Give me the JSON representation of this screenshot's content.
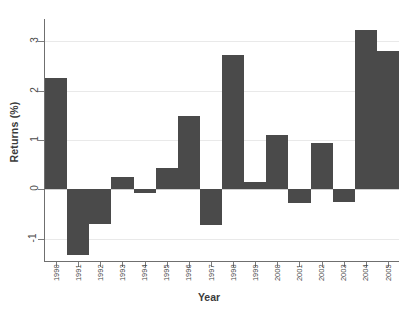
{
  "chart_data": {
    "type": "bar",
    "title": "",
    "xlabel": "Year",
    "ylabel": "Returns (%)",
    "categories": [
      "1990",
      "1991",
      "1992",
      "1993",
      "1994",
      "1995",
      "1996",
      "1997",
      "1998",
      "1999",
      "2000",
      "2001",
      "2002",
      "2003",
      "2004",
      "2005"
    ],
    "values": [
      2.25,
      -1.33,
      -0.7,
      0.25,
      -0.07,
      0.43,
      1.48,
      -0.72,
      2.72,
      0.14,
      1.1,
      -0.27,
      0.94,
      -0.26,
      3.23,
      2.8
    ],
    "ylim": [
      -1.45,
      3.45
    ],
    "yticks": [
      -1,
      0,
      1,
      2,
      3
    ],
    "ytick_labels": [
      "-1",
      "0",
      "1",
      "2",
      "3"
    ],
    "grid": true,
    "gridlines": "horizontal",
    "legend": "none",
    "bar_color": "#4a4a4a",
    "grid_color": "#e9e9e9",
    "axis_color": "#6f6f6f",
    "background_color": "#ffffff",
    "bar_width_fraction": 1.0
  }
}
